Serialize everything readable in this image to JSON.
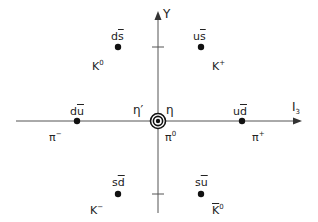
{
  "diagram": {
    "axes": {
      "x_label": "I",
      "x_label_sub": "3",
      "y_label": "Y"
    },
    "states": [
      {
        "id": "ds",
        "quark": "d",
        "antiquark": "s",
        "meson": "K",
        "meson_sup": "0",
        "meson_bar": false
      },
      {
        "id": "us",
        "quark": "u",
        "antiquark": "s",
        "meson": "K",
        "meson_sup": "+",
        "meson_bar": false
      },
      {
        "id": "du",
        "quark": "d",
        "antiquark": "u",
        "meson": "π",
        "meson_sup": "−",
        "meson_bar": false
      },
      {
        "id": "ud",
        "quark": "u",
        "antiquark": "d",
        "meson": "π",
        "meson_sup": "+",
        "meson_bar": false
      },
      {
        "id": "sd",
        "quark": "s",
        "antiquark": "d",
        "meson": "K",
        "meson_sup": "−",
        "meson_bar": false
      },
      {
        "id": "su",
        "quark": "s",
        "antiquark": "u",
        "meson": "K",
        "meson_sup": "0",
        "meson_bar": true
      }
    ],
    "center": {
      "labels": [
        "η′",
        "η",
        "π"
      ],
      "pi0_sup": "0"
    }
  }
}
